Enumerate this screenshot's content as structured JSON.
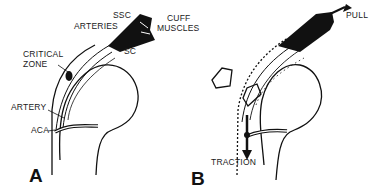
{
  "figure": {
    "panels": [
      {
        "id": "A",
        "letter": "A",
        "labels": {
          "ssc": "SSC",
          "arteries": "ARTERIES",
          "cuff_muscles_line1": "CUFF",
          "cuff_muscles_line2": "MUSCLES",
          "sc": "SC",
          "critical_zone_line1": "CRITICAL",
          "critical_zone_line2": "ZONE",
          "artery": "ARTERY",
          "aca": "ACA"
        }
      },
      {
        "id": "B",
        "letter": "B",
        "labels": {
          "pull": "PULL",
          "traction": "TRACTION"
        }
      }
    ],
    "colors": {
      "ink": "#111111",
      "background": "#ffffff"
    }
  }
}
